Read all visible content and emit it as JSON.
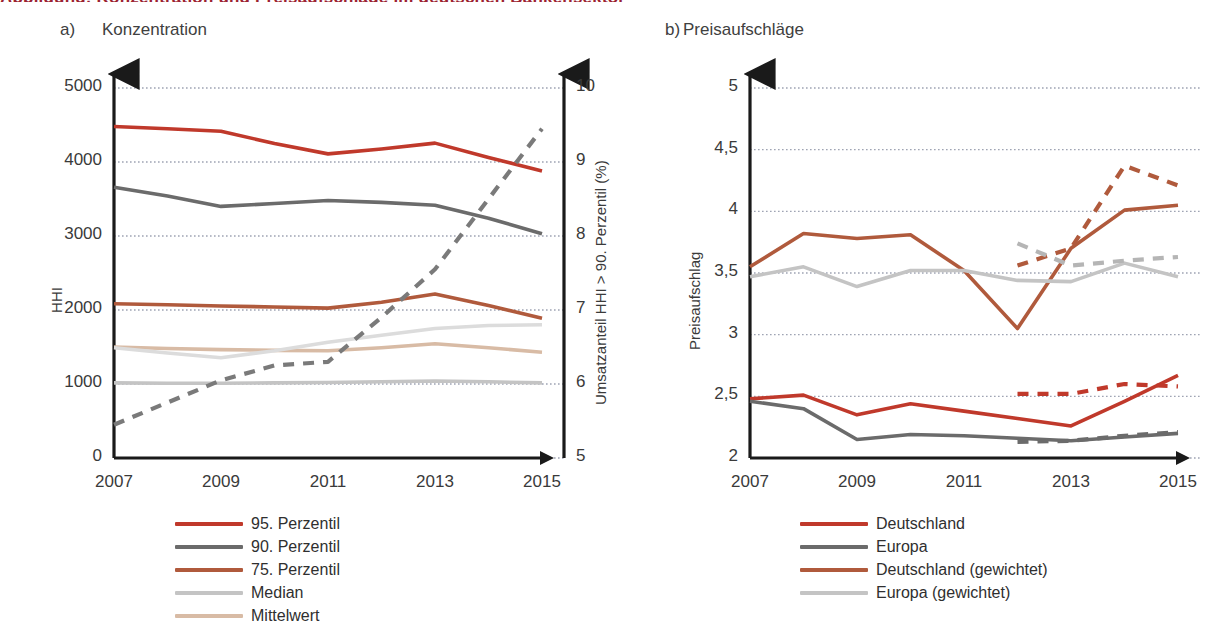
{
  "figure": {
    "cut_title": "Abbildung: Konzentration und Preisaufschläge im deutschen Bankensektor",
    "panel_a": {
      "tag": "a)",
      "title": "Konzentration"
    },
    "panel_b": {
      "tag": "b)",
      "title": "Preisaufschläge"
    }
  },
  "colors": {
    "red": "#C0392B",
    "dark_gray": "#6B6B6B",
    "rust": "#B05A3C",
    "light_gray": "#C4C4C4",
    "tan": "#D8BBA5",
    "pale_gray": "#D5D5D5",
    "axis": "#1a1a1a",
    "grid": "#9aa0b0"
  },
  "chart_data": [
    {
      "type": "line",
      "panel": "a",
      "title": "Konzentration",
      "xlabel": "",
      "ylabel": "HHI",
      "ylabel_right": "Umsatzanteil HHI > 90. Perzentil (%)",
      "x": [
        2007,
        2008,
        2009,
        2010,
        2011,
        2012,
        2013,
        2014,
        2015
      ],
      "xticks": [
        "2007",
        "2009",
        "2011",
        "2013",
        "2015"
      ],
      "xtick_values": [
        2007,
        2009,
        2011,
        2013,
        2015
      ],
      "yticks": [
        "0",
        "1000",
        "2000",
        "3000",
        "4000",
        "5000"
      ],
      "ylim": [
        0,
        5000
      ],
      "yticks_right": [
        "5",
        "6",
        "7",
        "8",
        "9",
        "10"
      ],
      "ylim_right": [
        5,
        10
      ],
      "grid": true,
      "legend_position": "below",
      "series": [
        {
          "name": "95. Perzentil",
          "color": "#C0392B",
          "style": "solid",
          "axis": "left",
          "values": [
            4480,
            4450,
            4415,
            4250,
            4110,
            4175,
            4255,
            4060,
            3880
          ]
        },
        {
          "name": "90. Perzentil",
          "color": "#6B6B6B",
          "style": "solid",
          "axis": "left",
          "values": [
            3660,
            3540,
            3400,
            3440,
            3480,
            3455,
            3415,
            3240,
            3030
          ]
        },
        {
          "name": "75. Perzentil",
          "color": "#B05A3C",
          "style": "solid",
          "axis": "left",
          "values": [
            2085,
            2070,
            2055,
            2040,
            2025,
            2105,
            2215,
            2060,
            1890
          ]
        },
        {
          "name": "Median",
          "color": "#C4C4C4",
          "style": "solid",
          "axis": "left",
          "values": [
            1015,
            1010,
            1010,
            1015,
            1020,
            1030,
            1040,
            1030,
            1015
          ]
        },
        {
          "name": "Mittelwert",
          "color": "#D8BBA5",
          "style": "solid",
          "axis": "left",
          "values": [
            1500,
            1480,
            1465,
            1455,
            1450,
            1490,
            1545,
            1490,
            1430
          ]
        },
        {
          "name": "Umsatzanteil (hell)",
          "color": "#DCDCDC",
          "style": "solid",
          "axis": "left",
          "values": [
            1490,
            1420,
            1355,
            1450,
            1565,
            1660,
            1750,
            1790,
            1800
          ]
        },
        {
          "name": "Umsatzanteil HHI > 90. Perzentil",
          "color": "#7A7A7A",
          "style": "dashed",
          "axis": "right",
          "values": [
            5.45,
            5.75,
            6.05,
            6.25,
            6.3,
            6.9,
            7.55,
            8.5,
            9.45
          ]
        }
      ]
    },
    {
      "type": "line",
      "panel": "b",
      "title": "Preisaufschläge",
      "xlabel": "",
      "ylabel": "Preisaufschlag",
      "x": [
        2007,
        2008,
        2009,
        2010,
        2011,
        2012,
        2013,
        2014,
        2015
      ],
      "xticks": [
        "2007",
        "2009",
        "2011",
        "2013",
        "2015"
      ],
      "xtick_values": [
        2007,
        2009,
        2011,
        2013,
        2015
      ],
      "yticks": [
        "2",
        "2,5",
        "3",
        "3,5",
        "4",
        "4,5",
        "5"
      ],
      "ylim": [
        2,
        5
      ],
      "grid": true,
      "legend_position": "below",
      "series": [
        {
          "name": "Deutschland",
          "color": "#C0392B",
          "style": "solid",
          "values": [
            2.48,
            2.51,
            2.35,
            2.44,
            2.38,
            2.32,
            2.26,
            2.46,
            2.67
          ]
        },
        {
          "name": "Europa",
          "color": "#6B6B6B",
          "style": "solid",
          "values": [
            2.46,
            2.4,
            2.15,
            2.19,
            2.18,
            2.16,
            2.14,
            2.17,
            2.2
          ]
        },
        {
          "name": "Deutschland (gewichtet)",
          "color": "#B05A3C",
          "style": "solid",
          "values": [
            3.55,
            3.82,
            3.78,
            3.81,
            3.52,
            3.05,
            3.7,
            4.01,
            4.05
          ]
        },
        {
          "name": "Europa (gewichtet)",
          "color": "#C4C4C4",
          "style": "solid",
          "values": [
            3.47,
            3.55,
            3.39,
            3.52,
            3.52,
            3.44,
            3.43,
            3.58,
            3.47
          ]
        },
        {
          "name": "Deutschland (Bruch, gestrichelt)",
          "color": "#C0392B",
          "style": "dashed",
          "values": [
            null,
            null,
            null,
            null,
            null,
            2.52,
            2.52,
            2.6,
            2.58
          ]
        },
        {
          "name": "Europa (Bruch, gestrichelt)",
          "color": "#6B6B6B",
          "style": "dashed",
          "values": [
            null,
            null,
            null,
            null,
            null,
            2.13,
            2.14,
            2.18,
            2.21
          ]
        },
        {
          "name": "Deutschland (gewichtet, gestrichelt)",
          "color": "#B05A3C",
          "style": "dashed",
          "values": [
            null,
            null,
            null,
            null,
            null,
            3.56,
            3.7,
            4.37,
            4.21
          ]
        },
        {
          "name": "Europa (gewichtet, gestrichelt)",
          "color": "#B5B5B5",
          "style": "dashed",
          "values": [
            null,
            null,
            null,
            null,
            null,
            3.74,
            3.56,
            3.6,
            3.63
          ]
        }
      ]
    }
  ],
  "legend_a": {
    "items": [
      {
        "label": "95. Perzentil",
        "color": "#C0392B"
      },
      {
        "label": "90. Perzentil",
        "color": "#6B6B6B"
      },
      {
        "label": "75. Perzentil",
        "color": "#B05A3C"
      },
      {
        "label": "Median",
        "color": "#C4C4C4"
      },
      {
        "label": "Mittelwert",
        "color": "#D8BBA5"
      }
    ]
  },
  "legend_b": {
    "items": [
      {
        "label": "Deutschland",
        "color": "#C0392B"
      },
      {
        "label": "Europa",
        "color": "#6B6B6B"
      },
      {
        "label": "Deutschland (gewichtet)",
        "color": "#B05A3C"
      },
      {
        "label": "Europa (gewichtet)",
        "color": "#C4C4C4"
      }
    ]
  }
}
